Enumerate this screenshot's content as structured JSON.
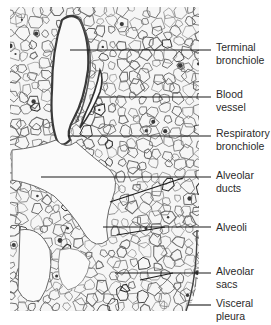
{
  "figure": {
    "tissue_bounds": {
      "x": 10,
      "y": 7,
      "right": 199,
      "bottom": 311
    },
    "colors": {
      "background": "#ffffff",
      "tissue_bg": "#f4f4f4",
      "septa": "#5a5a5a",
      "dark_stain": "#2e2e2e",
      "leader_line": "#1a1a1a",
      "label_text": "#2a2a2a"
    }
  },
  "labels": [
    {
      "id": "terminal-bronchiole",
      "line1": "Terminal",
      "line2": "bronchiole",
      "text_top": 41,
      "leaders": [
        {
          "x1": 70,
          "y1": 50,
          "x2": 211,
          "y2": 50
        }
      ]
    },
    {
      "id": "blood-vessel",
      "line1": "Blood",
      "line2": "vessel",
      "text_top": 88,
      "leaders": [
        {
          "x1": 98,
          "y1": 97,
          "x2": 211,
          "y2": 97
        }
      ]
    },
    {
      "id": "respiratory-bronchiole",
      "line1": "Respiratory",
      "line2": "bronchiole",
      "text_top": 127,
      "leaders": [
        {
          "x1": 68,
          "y1": 136,
          "x2": 211,
          "y2": 136
        }
      ]
    },
    {
      "id": "alveolar-ducts",
      "line1": "Alveolar",
      "line2": "ducts",
      "text_top": 169,
      "leaders": [
        {
          "x1": 41,
          "y1": 177,
          "x2": 211,
          "y2": 177
        },
        {
          "x1": 110,
          "y1": 202,
          "x2": 183,
          "y2": 178
        }
      ]
    },
    {
      "id": "alveoli",
      "line1": "Alveoli",
      "line2": "",
      "text_top": 221,
      "leaders": [
        {
          "x1": 103,
          "y1": 227,
          "x2": 211,
          "y2": 227
        },
        {
          "x1": 117,
          "y1": 235,
          "x2": 165,
          "y2": 227
        }
      ]
    },
    {
      "id": "alveolar-sacs",
      "line1": "Alveolar",
      "line2": "sacs",
      "text_top": 265,
      "leaders": [
        {
          "x1": 115,
          "y1": 273,
          "x2": 211,
          "y2": 273
        },
        {
          "x1": 140,
          "y1": 280,
          "x2": 173,
          "y2": 273
        }
      ]
    },
    {
      "id": "visceral-pleura",
      "line1": "Visceral",
      "line2": "pleura",
      "text_top": 297,
      "leaders": [
        {
          "x1": 188,
          "y1": 305,
          "x2": 211,
          "y2": 305
        }
      ]
    }
  ]
}
